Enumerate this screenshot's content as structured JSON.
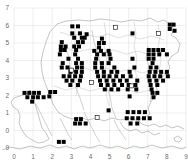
{
  "figure": {
    "title": "",
    "background_color": "#ffffff"
  },
  "chart_data": {
    "type": "scatter",
    "title": "",
    "subtitle": "",
    "xlabel": "",
    "ylabel": "",
    "xlim": [
      0,
      9
    ],
    "ylim": [
      9,
      7
    ],
    "grid": true,
    "legend_position": "none",
    "x_tick_labels": [
      "0",
      "1",
      "2",
      "3",
      "4",
      "5",
      "6",
      "7",
      "8",
      "9"
    ],
    "y_tick_labels": [
      "7",
      "6",
      "5",
      "4",
      "3",
      "2",
      "1",
      "0",
      "9"
    ],
    "x_ticks": [
      0,
      1,
      2,
      3,
      4,
      5,
      6,
      7,
      8,
      9
    ],
    "y_ticks": [
      7,
      6,
      5,
      4,
      3,
      2,
      1,
      0,
      9
    ],
    "marker": "square",
    "marker_size_px": 4,
    "series": [
      {
        "name": "recorded-present",
        "marker": "filled-square",
        "color": "#000000",
        "points": [
          [
            3.05,
            5.95
          ],
          [
            3.35,
            5.95
          ],
          [
            8.15,
            6.05
          ],
          [
            8.35,
            6.05
          ],
          [
            8.15,
            5.8
          ],
          [
            8.4,
            5.7
          ],
          [
            3.05,
            5.55
          ],
          [
            3.45,
            5.55
          ],
          [
            3.8,
            5.5
          ],
          [
            6.2,
            5.55
          ],
          [
            3.15,
            5.3
          ],
          [
            3.55,
            5.3
          ],
          [
            3.7,
            5.3
          ],
          [
            4.6,
            5.25
          ],
          [
            2.5,
            5.05
          ],
          [
            3.35,
            5.05
          ],
          [
            3.6,
            5.05
          ],
          [
            4.45,
            5.0
          ],
          [
            4.7,
            5.0
          ],
          [
            2.45,
            4.8
          ],
          [
            2.7,
            4.8
          ],
          [
            3.15,
            4.8
          ],
          [
            3.4,
            4.8
          ],
          [
            4.45,
            4.75
          ],
          [
            2.45,
            4.6
          ],
          [
            2.65,
            4.6
          ],
          [
            3.25,
            4.6
          ],
          [
            4.2,
            4.55
          ],
          [
            4.55,
            4.55
          ],
          [
            4.95,
            4.55
          ],
          [
            7.05,
            4.6
          ],
          [
            7.3,
            4.6
          ],
          [
            7.55,
            4.6
          ],
          [
            7.8,
            4.6
          ],
          [
            2.4,
            4.35
          ],
          [
            3.2,
            4.35
          ],
          [
            4.35,
            4.35
          ],
          [
            4.7,
            4.35
          ],
          [
            5.0,
            4.35
          ],
          [
            7.05,
            4.35
          ],
          [
            7.3,
            4.35
          ],
          [
            7.6,
            4.35
          ],
          [
            8.0,
            4.35
          ],
          [
            2.85,
            4.1
          ],
          [
            3.35,
            4.1
          ],
          [
            4.3,
            4.1
          ],
          [
            5.05,
            4.1
          ],
          [
            6.2,
            4.1
          ],
          [
            7.05,
            4.1
          ],
          [
            7.3,
            4.1
          ],
          [
            2.55,
            3.85
          ],
          [
            3.25,
            3.85
          ],
          [
            3.55,
            3.85
          ],
          [
            4.25,
            3.85
          ],
          [
            4.6,
            3.85
          ],
          [
            4.95,
            3.85
          ],
          [
            7.25,
            3.85
          ],
          [
            2.5,
            3.6
          ],
          [
            2.8,
            3.6
          ],
          [
            3.3,
            3.6
          ],
          [
            3.55,
            3.6
          ],
          [
            4.25,
            3.6
          ],
          [
            4.6,
            3.6
          ],
          [
            5.25,
            3.6
          ],
          [
            6.3,
            3.6
          ],
          [
            7.15,
            3.6
          ],
          [
            7.45,
            3.6
          ],
          [
            2.95,
            3.35
          ],
          [
            3.25,
            3.35
          ],
          [
            3.55,
            3.35
          ],
          [
            4.35,
            3.35
          ],
          [
            4.7,
            3.35
          ],
          [
            5.1,
            3.35
          ],
          [
            5.4,
            3.35
          ],
          [
            6.05,
            3.35
          ],
          [
            7.1,
            3.35
          ],
          [
            7.4,
            3.35
          ],
          [
            7.7,
            3.35
          ],
          [
            8.0,
            3.35
          ],
          [
            2.6,
            3.1
          ],
          [
            2.9,
            3.1
          ],
          [
            3.2,
            3.1
          ],
          [
            3.5,
            3.1
          ],
          [
            4.4,
            3.1
          ],
          [
            4.7,
            3.1
          ],
          [
            5.0,
            3.1
          ],
          [
            5.35,
            3.1
          ],
          [
            5.7,
            3.1
          ],
          [
            6.1,
            3.1
          ],
          [
            7.05,
            3.1
          ],
          [
            7.35,
            3.1
          ],
          [
            7.65,
            3.1
          ],
          [
            8.05,
            3.1
          ],
          [
            2.75,
            2.85
          ],
          [
            3.05,
            2.85
          ],
          [
            3.45,
            2.85
          ],
          [
            4.5,
            2.85
          ],
          [
            4.85,
            2.85
          ],
          [
            5.2,
            2.85
          ],
          [
            5.55,
            2.85
          ],
          [
            5.9,
            2.85
          ],
          [
            6.45,
            2.85
          ],
          [
            7.1,
            2.85
          ],
          [
            7.45,
            2.85
          ],
          [
            7.8,
            2.85
          ],
          [
            2.95,
            2.6
          ],
          [
            3.35,
            2.6
          ],
          [
            4.55,
            2.6
          ],
          [
            4.9,
            2.6
          ],
          [
            5.25,
            2.6
          ],
          [
            5.65,
            2.6
          ],
          [
            6.0,
            2.6
          ],
          [
            6.35,
            2.6
          ],
          [
            7.15,
            2.6
          ],
          [
            7.5,
            2.6
          ],
          [
            4.75,
            2.35
          ],
          [
            5.1,
            2.35
          ],
          [
            5.45,
            2.35
          ],
          [
            5.95,
            2.35
          ],
          [
            6.4,
            2.35
          ],
          [
            7.2,
            2.35
          ],
          [
            0.55,
            2.15
          ],
          [
            0.8,
            2.15
          ],
          [
            1.05,
            2.15
          ],
          [
            1.3,
            2.15
          ],
          [
            1.9,
            2.2
          ],
          [
            2.15,
            2.2
          ],
          [
            7.25,
            2.15
          ],
          [
            7.5,
            2.15
          ],
          [
            0.7,
            1.9
          ],
          [
            1.0,
            1.9
          ],
          [
            1.25,
            1.9
          ],
          [
            1.55,
            1.9
          ],
          [
            1.85,
            1.95
          ],
          [
            6.05,
            1.95
          ],
          [
            7.3,
            1.9
          ],
          [
            0.95,
            1.65
          ],
          [
            4.95,
            1.15
          ],
          [
            5.95,
            1.05
          ],
          [
            6.25,
            1.05
          ],
          [
            6.55,
            1.05
          ],
          [
            6.85,
            1.05
          ],
          [
            3.25,
            0.65
          ],
          [
            3.5,
            0.65
          ],
          [
            5.9,
            0.7
          ],
          [
            6.2,
            0.7
          ],
          [
            6.5,
            0.7
          ],
          [
            6.8,
            0.7
          ],
          [
            7.1,
            0.7
          ],
          [
            3.2,
            0.4
          ],
          [
            3.45,
            0.4
          ],
          [
            3.75,
            0.4
          ],
          [
            6.1,
            0.4
          ],
          [
            6.45,
            0.4
          ],
          [
            2.35,
            9.35
          ],
          [
            2.6,
            9.35
          ]
        ]
      },
      {
        "name": "pre-1970-record",
        "marker": "open-square",
        "color": "#ffffff",
        "points": [
          [
            3.0,
            3.45
          ],
          [
            4.05,
            2.75
          ],
          [
            5.3,
            5.9
          ],
          [
            7.55,
            5.55
          ],
          [
            6.15,
            2.55
          ],
          [
            4.35,
            0.75
          ]
        ]
      }
    ]
  }
}
